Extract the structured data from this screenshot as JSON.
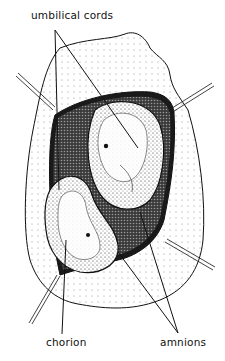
{
  "figure": {
    "colors": {
      "ink": "#111111",
      "background": "#ffffff"
    },
    "labels": {
      "umbilical_cords": "umbilical cords",
      "chorion": "chorion",
      "amnions": "amnions"
    }
  }
}
